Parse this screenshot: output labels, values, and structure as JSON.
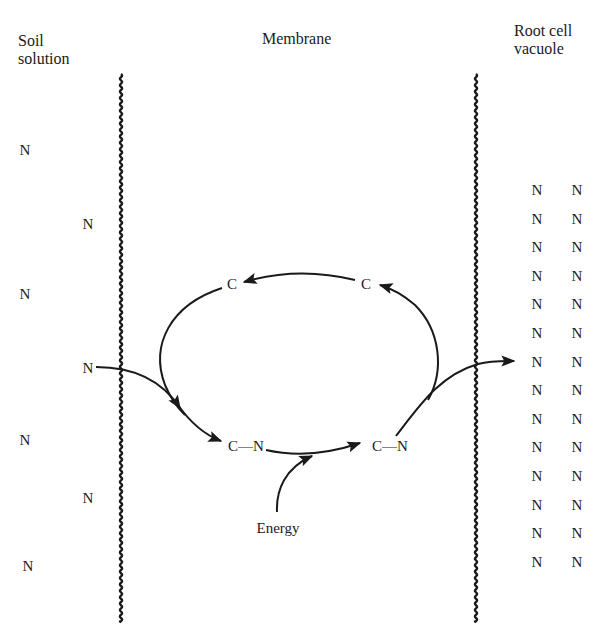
{
  "diagram": {
    "headers": {
      "soil_solution": {
        "line1": "Soil",
        "line2": "solution"
      },
      "membrane": "Membrane",
      "root_cell_vacuole": {
        "line1": "Root cell",
        "line2": "vacuole"
      }
    },
    "soil_nitrogen": [
      {
        "label": "N",
        "x": 25,
        "y": 150
      },
      {
        "label": "N",
        "x": 88,
        "y": 224
      },
      {
        "label": "N",
        "x": 25,
        "y": 294
      },
      {
        "label": "N",
        "x": 88,
        "y": 368
      },
      {
        "label": "N",
        "x": 25,
        "y": 440
      },
      {
        "label": "N",
        "x": 88,
        "y": 498
      },
      {
        "label": "N",
        "x": 28,
        "y": 566
      }
    ],
    "carrier_cycle": {
      "carrier_top_left": "C",
      "carrier_top_right": "C",
      "complex_left": "C—N",
      "complex_right": "C—N",
      "energy_label": "Energy"
    },
    "vacuole_nitrogen": {
      "label": "N",
      "columns": 2,
      "rows": 14
    },
    "colors": {
      "ink": "#1a1a1a",
      "background": "#ffffff"
    }
  }
}
